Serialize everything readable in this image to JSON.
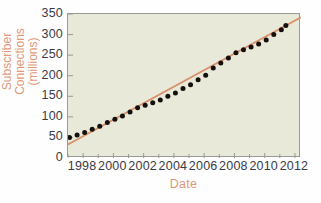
{
  "chart_data": {
    "type": "scatter",
    "title": "",
    "xlabel": "Date",
    "ylabel": "Subscriber\nConnections (millions)",
    "xlim": [
      1997,
      2012.4
    ],
    "ylim": [
      0,
      350
    ],
    "grid": false,
    "legend": null,
    "colors": {
      "plot_background": "#e8e9d9",
      "figure_background": "#fefefe",
      "trendline": "#d98f6b",
      "marker": "#15100d",
      "axis_title": "#e09878",
      "tick_label": "#3a3a46",
      "frame": "#9a9a96"
    },
    "xticks": [
      1998,
      2000,
      2002,
      2004,
      2006,
      2008,
      2010,
      2012
    ],
    "xtick_labels": [
      "1998",
      "2000",
      "2002",
      "2004",
      "2006",
      "2008",
      "2010",
      "2012"
    ],
    "xminor_ticks": [
      1997,
      1998,
      1999,
      2000,
      2001,
      2002,
      2003,
      2004,
      2005,
      2006,
      2007,
      2008,
      2009,
      2010,
      2011,
      2012
    ],
    "yticks": [
      0,
      50,
      100,
      150,
      200,
      250,
      300,
      350
    ],
    "ytick_labels": [
      "0",
      "50",
      "100",
      "150",
      "200",
      "250",
      "300",
      "350"
    ],
    "series": [
      {
        "name": "Subscriber connections",
        "marker": "filled-circle",
        "x": [
          1997.1,
          1997.6,
          1998.1,
          1998.6,
          1999.1,
          1999.6,
          2000.1,
          2000.6,
          2001.1,
          2001.6,
          2002.1,
          2002.6,
          2003.1,
          2003.6,
          2004.1,
          2004.6,
          2005.1,
          2005.6,
          2006.1,
          2006.6,
          2007.1,
          2007.6,
          2008.1,
          2008.6,
          2009.1,
          2009.6,
          2010.1,
          2010.6,
          2011.1,
          2011.4
        ],
        "values": [
          50,
          56,
          62,
          70,
          77,
          86,
          94,
          102,
          112,
          122,
          128,
          134,
          141,
          150,
          158,
          169,
          178,
          190,
          201,
          219,
          231,
          243,
          256,
          263,
          270,
          277,
          287,
          300,
          312,
          322
        ]
      }
    ],
    "trendline": {
      "name": "linear fit",
      "x": [
        1997.0,
        2012.4
      ],
      "y": [
        33,
        342
      ]
    }
  }
}
